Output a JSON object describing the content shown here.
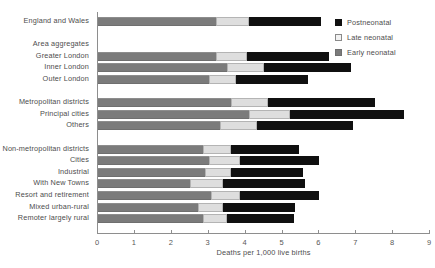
{
  "chart_data": {
    "type": "bar",
    "orientation": "horizontal",
    "stacked": true,
    "title": "",
    "xlabel": "Deaths per 1,000 live births",
    "ylabel": "",
    "xlim": [
      0,
      9
    ],
    "xticks": [
      0,
      1,
      2,
      3,
      4,
      5,
      6,
      7,
      8,
      9
    ],
    "xtick_labels": [
      "0",
      "1",
      "2",
      "3",
      "4",
      "5",
      "6",
      "7",
      "8",
      "9"
    ],
    "grid": false,
    "legend_position": "top-right",
    "series": [
      {
        "name": "Postneonatal",
        "color": "#101010",
        "values": [
          1.95,
          null,
          null,
          2.2,
          2.35,
          1.95,
          null,
          2.9,
          3.1,
          2.6,
          null,
          1.85,
          2.15,
          1.95,
          2.2,
          2.15,
          1.95,
          1.8
        ]
      },
      {
        "name": "Late neonatal",
        "color": "#dedede",
        "values": [
          0.9,
          null,
          null,
          0.85,
          1.0,
          0.75,
          null,
          1.0,
          1.1,
          1.0,
          null,
          0.75,
          0.85,
          0.7,
          0.9,
          0.8,
          0.7,
          0.65
        ]
      },
      {
        "name": "Early neonatal",
        "color": "#7b7b7b",
        "values": [
          3.2,
          null,
          null,
          3.2,
          3.5,
          3.0,
          null,
          3.6,
          4.1,
          3.3,
          null,
          2.85,
          3.0,
          2.9,
          2.5,
          3.05,
          2.7,
          2.85
        ]
      }
    ],
    "categories": [
      "England and Wales",
      "",
      "Area aggregates",
      "Greater London",
      "Inner London",
      "Outer London",
      "",
      "Metropolitan districts",
      "Principal cities",
      "Others",
      "",
      "Non-metropolitan districts",
      "Cities",
      "Industrial",
      "With New Towns",
      "Resort and retirement",
      "Mixed urban-rural",
      "Remoter largely rural"
    ],
    "totals": [
      6.05,
      null,
      null,
      6.25,
      6.85,
      5.7,
      null,
      7.5,
      8.3,
      6.9,
      null,
      5.45,
      6.0,
      5.55,
      5.6,
      6.0,
      5.35,
      5.3
    ]
  },
  "rows": [
    {
      "label": "England and Wales",
      "header": false,
      "spacer": false,
      "early": 3.2,
      "late": 0.9,
      "post": 1.95
    },
    {
      "label": "",
      "header": false,
      "spacer": true,
      "early": null,
      "late": null,
      "post": null
    },
    {
      "label": "Area aggregates",
      "header": true,
      "spacer": false,
      "early": null,
      "late": null,
      "post": null
    },
    {
      "label": "Greater London",
      "header": false,
      "spacer": false,
      "early": 3.2,
      "late": 0.85,
      "post": 2.2
    },
    {
      "label": "Inner London",
      "header": false,
      "spacer": false,
      "early": 3.5,
      "late": 1.0,
      "post": 2.35
    },
    {
      "label": "Outer London",
      "header": false,
      "spacer": false,
      "early": 3.0,
      "late": 0.75,
      "post": 1.95
    },
    {
      "label": "",
      "header": false,
      "spacer": true,
      "early": null,
      "late": null,
      "post": null
    },
    {
      "label": "Metropolitan districts",
      "header": false,
      "spacer": false,
      "early": 3.6,
      "late": 1.0,
      "post": 2.9
    },
    {
      "label": "Principal cities",
      "header": false,
      "spacer": false,
      "early": 4.1,
      "late": 1.1,
      "post": 3.1
    },
    {
      "label": "Others",
      "header": false,
      "spacer": false,
      "early": 3.3,
      "late": 1.0,
      "post": 2.6
    },
    {
      "label": "",
      "header": false,
      "spacer": true,
      "early": null,
      "late": null,
      "post": null
    },
    {
      "label": "Non-metropolitan districts",
      "header": false,
      "spacer": false,
      "early": 2.85,
      "late": 0.75,
      "post": 1.85
    },
    {
      "label": "Cities",
      "header": false,
      "spacer": false,
      "early": 3.0,
      "late": 0.85,
      "post": 2.15
    },
    {
      "label": "Industrial",
      "header": false,
      "spacer": false,
      "early": 2.9,
      "late": 0.7,
      "post": 1.95
    },
    {
      "label": "With New Towns",
      "header": false,
      "spacer": false,
      "early": 2.5,
      "late": 0.9,
      "post": 2.2
    },
    {
      "label": "Resort and retirement",
      "header": false,
      "spacer": false,
      "early": 3.05,
      "late": 0.8,
      "post": 2.15
    },
    {
      "label": "Mixed urban-rural",
      "header": false,
      "spacer": false,
      "early": 2.7,
      "late": 0.7,
      "post": 1.95
    },
    {
      "label": "Remoter largely rural",
      "header": false,
      "spacer": false,
      "early": 2.85,
      "late": 0.65,
      "post": 1.8
    }
  ],
  "legend": {
    "items": [
      {
        "label": "Postneonatal",
        "swatch": "sw-post"
      },
      {
        "label": "Late neonatal",
        "swatch": "sw-late"
      },
      {
        "label": "Early neonatal",
        "swatch": "sw-early"
      }
    ]
  },
  "axis": {
    "x_title": "Deaths per 1,000 live births",
    "ticks": [
      "0",
      "1",
      "2",
      "3",
      "4",
      "5",
      "6",
      "7",
      "8",
      "9"
    ]
  }
}
